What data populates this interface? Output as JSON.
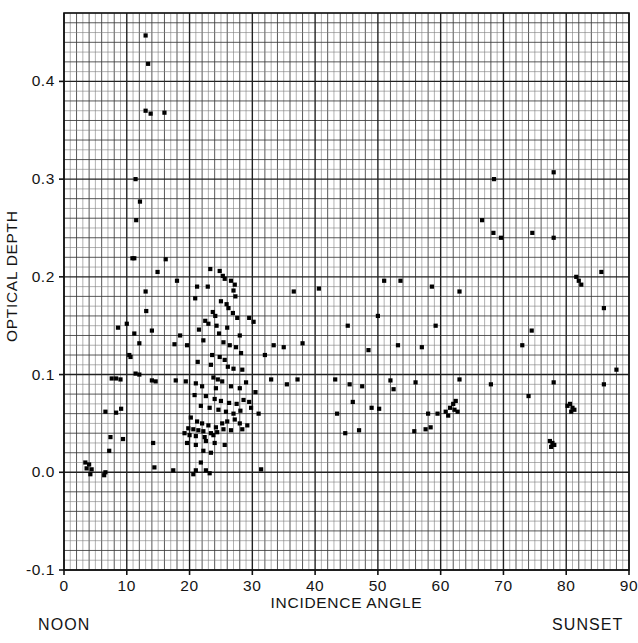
{
  "chart_data": {
    "type": "scatter",
    "title": "",
    "xlabel": "INCIDENCE ANGLE",
    "ylabel": "OPTICAL DEPTH",
    "xlim": [
      0,
      90
    ],
    "ylim": [
      -0.1,
      0.47
    ],
    "xticks": [
      0,
      10,
      20,
      30,
      40,
      50,
      60,
      70,
      80,
      90
    ],
    "xtick_labels": [
      "0",
      "10",
      "20",
      "30",
      "40",
      "50",
      "60",
      "70",
      "80",
      "90"
    ],
    "yticks": [
      -0.1,
      0.0,
      0.1,
      0.2,
      0.3,
      0.4
    ],
    "ytick_labels": [
      "-0.1",
      "0.0",
      "0.1",
      "0.2",
      "0.3",
      "0.4"
    ],
    "grid": "major-and-minor",
    "minor_per_major": 10,
    "legend": "none",
    "marker": "square",
    "marker_color": "#000000",
    "annotations": [
      {
        "text": "NOON",
        "position": "below-left-of-axis"
      },
      {
        "text": "SUNSET",
        "position": "below-right-of-axis"
      }
    ],
    "points": [
      [
        13.0,
        0.447
      ],
      [
        13.4,
        0.418
      ],
      [
        13.0,
        0.37
      ],
      [
        13.8,
        0.367
      ],
      [
        16.0,
        0.368
      ],
      [
        11.4,
        0.3
      ],
      [
        12.1,
        0.277
      ],
      [
        11.5,
        0.258
      ],
      [
        10.9,
        0.219
      ],
      [
        11.2,
        0.219
      ],
      [
        16.2,
        0.218
      ],
      [
        14.9,
        0.205
      ],
      [
        18.0,
        0.196
      ],
      [
        21.2,
        0.19
      ],
      [
        22.9,
        0.19
      ],
      [
        13.0,
        0.185
      ],
      [
        20.9,
        0.178
      ],
      [
        13.1,
        0.165
      ],
      [
        23.3,
        0.208
      ],
      [
        24.8,
        0.206
      ],
      [
        25.3,
        0.201
      ],
      [
        25.6,
        0.198
      ],
      [
        26.6,
        0.196
      ],
      [
        27.2,
        0.192
      ],
      [
        27.0,
        0.186
      ],
      [
        27.3,
        0.18
      ],
      [
        25.0,
        0.175
      ],
      [
        25.9,
        0.172
      ],
      [
        26.2,
        0.168
      ],
      [
        23.7,
        0.164
      ],
      [
        24.1,
        0.16
      ],
      [
        26.9,
        0.163
      ],
      [
        27.6,
        0.158
      ],
      [
        22.5,
        0.155
      ],
      [
        23.0,
        0.152
      ],
      [
        24.3,
        0.15
      ],
      [
        26.0,
        0.148
      ],
      [
        21.5,
        0.146
      ],
      [
        24.7,
        0.142
      ],
      [
        28.0,
        0.14
      ],
      [
        10.0,
        0.152
      ],
      [
        8.6,
        0.148
      ],
      [
        11.2,
        0.142
      ],
      [
        14.0,
        0.145
      ],
      [
        18.5,
        0.14
      ],
      [
        12.0,
        0.132
      ],
      [
        17.6,
        0.131
      ],
      [
        19.6,
        0.13
      ],
      [
        22.2,
        0.135
      ],
      [
        25.4,
        0.133
      ],
      [
        26.4,
        0.13
      ],
      [
        27.4,
        0.128
      ],
      [
        28.2,
        0.122
      ],
      [
        10.4,
        0.12
      ],
      [
        10.6,
        0.118
      ],
      [
        23.6,
        0.12
      ],
      [
        24.8,
        0.118
      ],
      [
        25.6,
        0.115
      ],
      [
        21.3,
        0.113
      ],
      [
        23.4,
        0.11
      ],
      [
        26.1,
        0.108
      ],
      [
        27.0,
        0.106
      ],
      [
        28.4,
        0.105
      ],
      [
        11.4,
        0.101
      ],
      [
        12.0,
        0.1
      ],
      [
        7.6,
        0.096
      ],
      [
        8.3,
        0.096
      ],
      [
        9.0,
        0.095
      ],
      [
        14.0,
        0.094
      ],
      [
        14.6,
        0.093
      ],
      [
        17.8,
        0.094
      ],
      [
        19.4,
        0.093
      ],
      [
        21.0,
        0.091
      ],
      [
        23.8,
        0.097
      ],
      [
        24.5,
        0.095
      ],
      [
        25.2,
        0.093
      ],
      [
        22.0,
        0.088
      ],
      [
        24.2,
        0.086
      ],
      [
        26.6,
        0.088
      ],
      [
        28.0,
        0.086
      ],
      [
        29.0,
        0.092
      ],
      [
        30.5,
        0.082
      ],
      [
        33.0,
        0.095
      ],
      [
        35.5,
        0.09
      ],
      [
        37.2,
        0.095
      ],
      [
        43.2,
        0.095
      ],
      [
        45.5,
        0.09
      ],
      [
        47.5,
        0.088
      ],
      [
        52.0,
        0.094
      ],
      [
        56.0,
        0.092
      ],
      [
        63.0,
        0.095
      ],
      [
        68.0,
        0.09
      ],
      [
        78.0,
        0.092
      ],
      [
        86.0,
        0.09
      ],
      [
        88.0,
        0.105
      ],
      [
        20.8,
        0.079
      ],
      [
        22.6,
        0.078
      ],
      [
        24.0,
        0.075
      ],
      [
        25.0,
        0.073
      ],
      [
        26.3,
        0.071
      ],
      [
        27.5,
        0.07
      ],
      [
        28.6,
        0.074
      ],
      [
        29.5,
        0.072
      ],
      [
        21.8,
        0.068
      ],
      [
        23.2,
        0.066
      ],
      [
        24.6,
        0.064
      ],
      [
        25.8,
        0.062
      ],
      [
        27.0,
        0.06
      ],
      [
        28.1,
        0.063
      ],
      [
        29.8,
        0.066
      ],
      [
        31.0,
        0.06
      ],
      [
        6.6,
        0.062
      ],
      [
        8.3,
        0.061
      ],
      [
        9.1,
        0.065
      ],
      [
        49.0,
        0.066
      ],
      [
        50.2,
        0.065
      ],
      [
        58.0,
        0.06
      ],
      [
        59.5,
        0.06
      ],
      [
        60.8,
        0.062
      ],
      [
        61.5,
        0.066
      ],
      [
        62.0,
        0.07
      ],
      [
        62.4,
        0.073
      ],
      [
        62.2,
        0.064
      ],
      [
        62.7,
        0.062
      ],
      [
        61.2,
        0.058
      ],
      [
        80.2,
        0.068
      ],
      [
        80.6,
        0.07
      ],
      [
        81.0,
        0.066
      ],
      [
        80.8,
        0.062
      ],
      [
        81.3,
        0.064
      ],
      [
        74.0,
        0.078
      ],
      [
        20.2,
        0.056
      ],
      [
        21.2,
        0.052
      ],
      [
        22.0,
        0.05
      ],
      [
        23.0,
        0.048
      ],
      [
        24.2,
        0.046
      ],
      [
        25.2,
        0.05
      ],
      [
        26.0,
        0.052
      ],
      [
        27.2,
        0.054
      ],
      [
        28.0,
        0.05
      ],
      [
        19.8,
        0.045
      ],
      [
        20.6,
        0.044
      ],
      [
        21.4,
        0.043
      ],
      [
        22.2,
        0.042
      ],
      [
        23.4,
        0.04
      ],
      [
        24.4,
        0.041
      ],
      [
        25.4,
        0.044
      ],
      [
        26.6,
        0.043
      ],
      [
        28.4,
        0.044
      ],
      [
        29.2,
        0.048
      ],
      [
        19.2,
        0.04
      ],
      [
        20.0,
        0.038
      ],
      [
        21.0,
        0.037
      ],
      [
        22.4,
        0.036
      ],
      [
        23.8,
        0.038
      ],
      [
        44.8,
        0.04
      ],
      [
        47.0,
        0.043
      ],
      [
        55.8,
        0.042
      ],
      [
        57.6,
        0.044
      ],
      [
        58.4,
        0.046
      ],
      [
        77.4,
        0.032
      ],
      [
        77.8,
        0.03
      ],
      [
        78.1,
        0.028
      ],
      [
        77.6,
        0.026
      ],
      [
        7.4,
        0.036
      ],
      [
        9.4,
        0.034
      ],
      [
        14.2,
        0.03
      ],
      [
        19.6,
        0.03
      ],
      [
        21.0,
        0.028
      ],
      [
        22.6,
        0.032
      ],
      [
        24.0,
        0.03
      ],
      [
        25.6,
        0.028
      ],
      [
        7.2,
        0.022
      ],
      [
        22.2,
        0.022
      ],
      [
        23.4,
        0.02
      ],
      [
        3.4,
        0.01
      ],
      [
        4.0,
        0.008
      ],
      [
        3.6,
        0.004
      ],
      [
        4.4,
        0.003
      ],
      [
        6.6,
        0.0
      ],
      [
        14.4,
        0.005
      ],
      [
        17.4,
        0.002
      ],
      [
        21.0,
        0.002
      ],
      [
        22.6,
        0.002
      ],
      [
        31.4,
        0.003
      ],
      [
        20.6,
        -0.002
      ],
      [
        23.2,
        -0.001
      ],
      [
        4.2,
        -0.002
      ],
      [
        6.4,
        -0.003
      ],
      [
        21.8,
        0.01
      ],
      [
        43.5,
        0.06
      ],
      [
        46.0,
        0.072
      ],
      [
        52.5,
        0.085
      ],
      [
        53.2,
        0.13
      ],
      [
        57.0,
        0.128
      ],
      [
        48.5,
        0.125
      ],
      [
        50.0,
        0.16
      ],
      [
        51.0,
        0.196
      ],
      [
        45.2,
        0.15
      ],
      [
        59.2,
        0.15
      ],
      [
        66.6,
        0.258
      ],
      [
        68.4,
        0.245
      ],
      [
        69.6,
        0.24
      ],
      [
        74.6,
        0.245
      ],
      [
        78.0,
        0.24
      ],
      [
        68.5,
        0.3
      ],
      [
        78.0,
        0.307
      ],
      [
        81.6,
        0.2
      ],
      [
        82.0,
        0.196
      ],
      [
        82.4,
        0.192
      ],
      [
        85.6,
        0.205
      ],
      [
        63.0,
        0.185
      ],
      [
        58.6,
        0.19
      ],
      [
        53.6,
        0.196
      ],
      [
        40.6,
        0.188
      ],
      [
        36.6,
        0.185
      ],
      [
        33.4,
        0.13
      ],
      [
        35.0,
        0.128
      ],
      [
        38.0,
        0.132
      ],
      [
        29.5,
        0.158
      ],
      [
        30.2,
        0.154
      ],
      [
        32.0,
        0.12
      ],
      [
        73.0,
        0.13
      ],
      [
        74.5,
        0.145
      ],
      [
        86.0,
        0.168
      ]
    ]
  },
  "axis": {
    "frame": {
      "left": 64,
      "top": 13,
      "right": 629,
      "bottom": 570
    }
  }
}
